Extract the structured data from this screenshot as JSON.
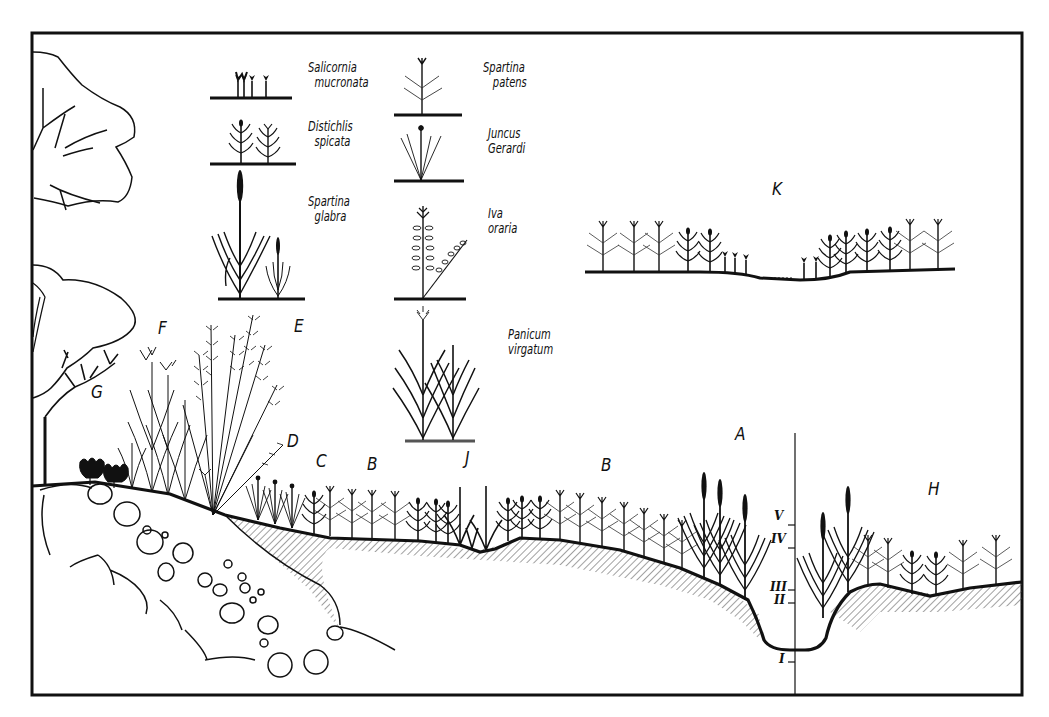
{
  "figure": {
    "frame": {
      "x": 32,
      "y": 33,
      "width": 990,
      "height": 662
    },
    "ink_color": "#111111",
    "paper_color": "#ffffff"
  },
  "legend": [
    {
      "id": "salicornia",
      "genus": "Salicornia",
      "species": "mucronata"
    },
    {
      "id": "distichlis",
      "genus": "Distichlis",
      "species": "spicata"
    },
    {
      "id": "spartina-glabra",
      "genus": "Spartina",
      "species": "glabra"
    },
    {
      "id": "spartina-patens",
      "genus": "Spartina",
      "species": "patens"
    },
    {
      "id": "juncus",
      "genus": "Juncus",
      "species": "Gerardi"
    },
    {
      "id": "iva",
      "genus": "Iva",
      "species": "oraria"
    },
    {
      "id": "panicum",
      "genus": "Panicum",
      "species": "virgatum"
    }
  ],
  "zones": [
    {
      "id": "A",
      "label": "A"
    },
    {
      "id": "B1",
      "label": "B"
    },
    {
      "id": "B2",
      "label": "B"
    },
    {
      "id": "C",
      "label": "C"
    },
    {
      "id": "D",
      "label": "D"
    },
    {
      "id": "E",
      "label": "E"
    },
    {
      "id": "F",
      "label": "F"
    },
    {
      "id": "G",
      "label": "G"
    },
    {
      "id": "H",
      "label": "H"
    },
    {
      "id": "J",
      "label": "J"
    },
    {
      "id": "K",
      "label": "K"
    }
  ],
  "tide_scale": {
    "levels": [
      "V",
      "IV",
      "III",
      "II",
      "I"
    ]
  }
}
